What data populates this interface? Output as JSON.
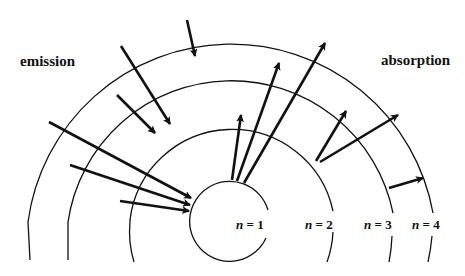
{
  "labels": {
    "emission": "emission",
    "absorption": "absorption"
  },
  "levels": [
    {
      "n": "n",
      "eq": " = 1",
      "radius": 40
    },
    {
      "n": "n",
      "eq": " = 2",
      "radius": 103
    },
    {
      "n": "n",
      "eq": " = 3",
      "radius": 165
    },
    {
      "n": "n",
      "eq": " = 4",
      "radius": 205
    }
  ],
  "colors": {
    "stroke": "#111111",
    "background": "#ffffff"
  }
}
